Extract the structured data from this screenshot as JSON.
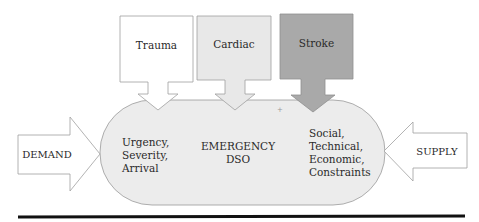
{
  "diagram": {
    "center": {
      "title_line1": "EMERGENCY",
      "title_line2": "DSO",
      "left_text": [
        "Urgency,",
        "Severity,",
        "Arrival"
      ],
      "right_text": [
        "Social,",
        "Technical,",
        "Economic,",
        "Constraints"
      ],
      "fill_color": "#ececec"
    },
    "inputs": [
      {
        "label": "Trauma",
        "fill_color": "#ffffff"
      },
      {
        "label": "Cardiac",
        "fill_color": "#e8e8e8"
      },
      {
        "label": "Stroke",
        "fill_color": "#a9a9a9"
      }
    ],
    "demand": {
      "label": "DEMAND"
    },
    "supply": {
      "label": "SUPPLY"
    }
  }
}
